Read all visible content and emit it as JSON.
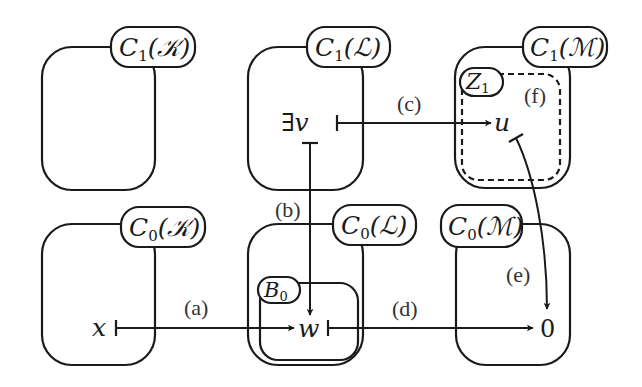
{
  "diagram": {
    "colors": {
      "stroke": "#1a1a1a",
      "background": "#ffffff",
      "label": "#333333"
    },
    "containers": [
      {
        "id": "c1k",
        "label_main": "C",
        "label_sub": "1",
        "label_arg": "(𝒦)",
        "row": "top",
        "column": "K"
      },
      {
        "id": "c1l",
        "label_main": "C",
        "label_sub": "1",
        "label_arg": "(ℒ)",
        "row": "top",
        "column": "L"
      },
      {
        "id": "c1m",
        "label_main": "C",
        "label_sub": "1",
        "label_arg": "(ℳ)",
        "row": "top",
        "column": "M"
      },
      {
        "id": "c0k",
        "label_main": "C",
        "label_sub": "0",
        "label_arg": "(𝒦)",
        "row": "bottom",
        "column": "K"
      },
      {
        "id": "c0l",
        "label_main": "C",
        "label_sub": "0",
        "label_arg": "(ℒ)",
        "row": "bottom",
        "column": "L"
      },
      {
        "id": "c0m",
        "label_main": "C",
        "label_sub": "0",
        "label_arg": "(ℳ)",
        "row": "bottom",
        "column": "M"
      }
    ],
    "subsets": [
      {
        "id": "z1",
        "label_main": "Z",
        "label_sub": "1",
        "style": "dashed",
        "inside": "c1m"
      },
      {
        "id": "b0",
        "label_main": "B",
        "label_sub": "0",
        "style": "solid",
        "inside": "c0l"
      }
    ],
    "elements": {
      "x": "x",
      "v": "∃v",
      "u": "u",
      "w": "w",
      "zero": "0"
    },
    "arrows": [
      {
        "label": "(a)",
        "from": "x",
        "to": "w"
      },
      {
        "label": "(b)",
        "from": "∃v",
        "to": "w"
      },
      {
        "label": "(c)",
        "from": "∃v",
        "to": "u"
      },
      {
        "label": "(d)",
        "from": "w",
        "to": "0"
      },
      {
        "label": "(e)",
        "from": "u",
        "to": "0"
      }
    ],
    "region_label_f": "(f)"
  }
}
